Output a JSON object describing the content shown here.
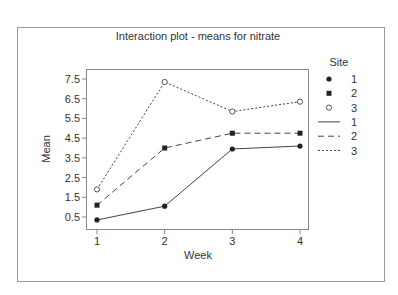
{
  "chart_data": {
    "type": "line",
    "title": "Interaction plot - means for nitrate",
    "xlabel": "Week",
    "ylabel": "Mean",
    "x": [
      1,
      2,
      3,
      4
    ],
    "categories": [
      "1",
      "2",
      "3",
      "4"
    ],
    "yticks": [
      "0.5",
      "1.5",
      "2.5",
      "3.5",
      "4.5",
      "5.5",
      "6.5",
      "7.5"
    ],
    "ylim": [
      0.0,
      8.0
    ],
    "grid": false,
    "legend_position": "right",
    "legend_title": "Site",
    "series": [
      {
        "name": "1",
        "values": [
          0.35,
          1.05,
          3.95,
          4.1
        ],
        "marker": "filled-circle",
        "line": "solid"
      },
      {
        "name": "2",
        "values": [
          1.1,
          4.0,
          4.75,
          4.75
        ],
        "marker": "filled-square",
        "line": "dashed"
      },
      {
        "name": "3",
        "values": [
          1.9,
          7.35,
          5.85,
          6.35
        ],
        "marker": "open-circle",
        "line": "dotted"
      }
    ]
  },
  "colors": {
    "frame": "#888888",
    "axis": "#777777",
    "line": "#333333",
    "text": "#333333"
  }
}
